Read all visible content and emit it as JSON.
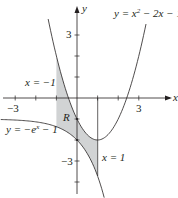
{
  "chart_data": {
    "type": "line",
    "title": "",
    "xlabel": "x",
    "ylabel": "y",
    "xlim": [
      -3.7,
      4.6
    ],
    "ylim": [
      -4.8,
      4.3
    ],
    "grid": false,
    "x_ticks": [
      -3,
      -2,
      -1,
      0,
      1,
      2,
      3
    ],
    "x_tick_labels": {
      "-3": "−3",
      "3": "3"
    },
    "y_ticks": [
      -4,
      -3,
      -2,
      -1,
      0,
      1,
      2,
      3
    ],
    "y_tick_labels": {
      "3": "3",
      "-3": "−3"
    },
    "series": [
      {
        "name": "y = x² − 2x − 1",
        "expression": "x^2 - 2x - 1",
        "x_range": [
          -1.4,
          3.35
        ]
      },
      {
        "name": "y = −e^x − 1",
        "expression": "-exp(x) - 1",
        "x_range": [
          -3.7,
          1.32
        ]
      }
    ],
    "vertical_lines": [
      {
        "label": "x = −1",
        "x": -1
      },
      {
        "label": "x = 1",
        "x": 1
      }
    ],
    "shaded_region": {
      "label": "R",
      "x_from": -1,
      "x_to": 1,
      "upper": "x^2 - 2x - 1",
      "lower": "-exp(x) - 1",
      "color": "#d1d3d4"
    },
    "annotations": [
      {
        "text": "y = x² − 2x − 1",
        "near": "top-right"
      },
      {
        "text": "x = −1",
        "near": "left, above x-axis"
      },
      {
        "text": "y = −eˣ − 1",
        "near": "left, below x-axis"
      },
      {
        "text": "x = 1",
        "near": "lower middle"
      },
      {
        "text": "R",
        "near": "shaded region"
      }
    ]
  },
  "labels": {
    "axis_x": "x",
    "axis_y": "y",
    "tick_x_neg3": "−3",
    "tick_x_3": "3",
    "tick_y_3": "3",
    "tick_y_neg3": "−3",
    "parabola_label_lhs": "y = x",
    "parabola_label_exp": "2",
    "parabola_label_rhs": " − 2x − 1",
    "exp_label_lhs": "y = −e",
    "exp_label_exp": "x",
    "exp_label_rhs": " − 1",
    "line_left_label": "x = −1",
    "line_right_label": "x = 1",
    "region_label": "R"
  },
  "colors": {
    "ink": "#231f20",
    "shade": "#d1d3d4"
  }
}
